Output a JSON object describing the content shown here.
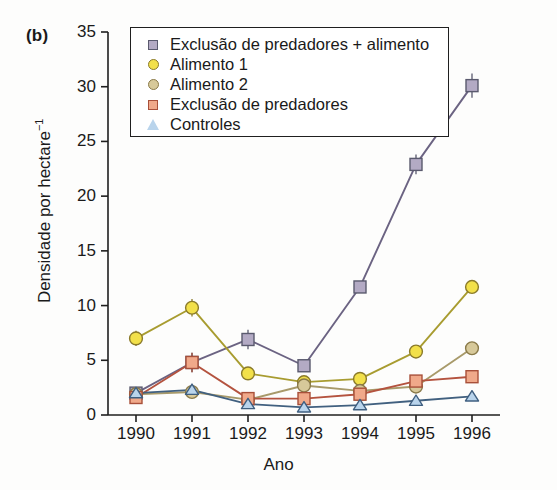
{
  "figure": {
    "panel_label": "(b)",
    "background_color": "#fdfdfc"
  },
  "chart_data": {
    "type": "line",
    "title": "",
    "panel": "(b)",
    "xlabel": "Ano",
    "ylabel": "Densidade por hectare⁻¹",
    "ylabel_base": "Densidade por hectare",
    "ylabel_exponent": "−1",
    "x": [
      1990,
      1991,
      1992,
      1993,
      1994,
      1995,
      1996
    ],
    "categories": [
      "1990",
      "1991",
      "1992",
      "1993",
      "1994",
      "1995",
      "1996"
    ],
    "xlim": [
      1989.5,
      1996.5
    ],
    "ylim": [
      0,
      35
    ],
    "yticks": [
      0,
      5,
      10,
      15,
      20,
      25,
      30,
      35
    ],
    "ytick_labels": [
      "0",
      "5",
      "10",
      "15",
      "20",
      "25",
      "30",
      "35"
    ],
    "xticks": [
      1990,
      1991,
      1992,
      1993,
      1994,
      1995,
      1996
    ],
    "grid": false,
    "legend_position": "top-center",
    "error_bars": true,
    "series": [
      {
        "name": "Exclusão de predadores + alimento",
        "marker": "square",
        "fill_color": "#b3aac4",
        "edge_color": "#5a5a6e",
        "line_color": "#6b6382",
        "values": [
          2.0,
          4.8,
          6.9,
          4.5,
          11.7,
          22.9,
          30.1
        ],
        "errors": [
          0.4,
          0.9,
          0.9,
          0.3,
          0.5,
          0.9,
          1.1
        ]
      },
      {
        "name": "Alimento 1",
        "marker": "circle",
        "fill_color": "#f2e04a",
        "edge_color": "#8a7a2a",
        "line_color": "#a89c30",
        "values": [
          7.0,
          9.8,
          3.8,
          3.0,
          3.3,
          5.8,
          11.7
        ],
        "errors": [
          0.7,
          0.8,
          0.3,
          0.3,
          0.3,
          0.3,
          0.3
        ]
      },
      {
        "name": "Alimento 2",
        "marker": "circle",
        "fill_color": "#d7c99a",
        "edge_color": "#8a7a4a",
        "line_color": "#a89a6a",
        "values": [
          1.9,
          2.1,
          1.4,
          2.7,
          2.2,
          2.6,
          6.1
        ],
        "errors": [
          0.3,
          0.3,
          0.2,
          0.2,
          0.2,
          0.2,
          0.3
        ]
      },
      {
        "name": "Exclusão de predadores",
        "marker": "square",
        "fill_color": "#f0a98a",
        "edge_color": "#a8503a",
        "line_color": "#b4533f",
        "values": [
          1.6,
          4.8,
          1.5,
          1.5,
          1.9,
          3.1,
          3.5
        ],
        "errors": [
          0.3,
          0.9,
          0.2,
          0.2,
          0.2,
          0.3,
          0.3
        ]
      },
      {
        "name": "Controles",
        "marker": "triangle",
        "fill_color": "#b9d4ec",
        "edge_color": "#3f5f80",
        "line_color": "#41607f",
        "values": [
          2.0,
          2.3,
          1.0,
          0.7,
          0.9,
          1.3,
          1.7
        ],
        "errors": [
          0.3,
          0.3,
          0.2,
          0.2,
          0.2,
          0.2,
          0.2
        ]
      }
    ]
  },
  "legend": {
    "items": [
      {
        "label": "Exclusão de predadores + alimento",
        "marker": "square",
        "fill": "#b3aac4",
        "edge": "#5a5a6e"
      },
      {
        "label": "Alimento 1",
        "marker": "circle",
        "fill": "#f2e04a",
        "edge": "#8a7a2a"
      },
      {
        "label": "Alimento 2",
        "marker": "circle",
        "fill": "#d7c99a",
        "edge": "#8a7a4a"
      },
      {
        "label": "Exclusão de predadores",
        "marker": "square",
        "fill": "#f0a98a",
        "edge": "#a8503a"
      },
      {
        "label": "Controles",
        "marker": "triangle",
        "fill": "#b9d4ec",
        "edge": "#3f5f80"
      }
    ]
  }
}
